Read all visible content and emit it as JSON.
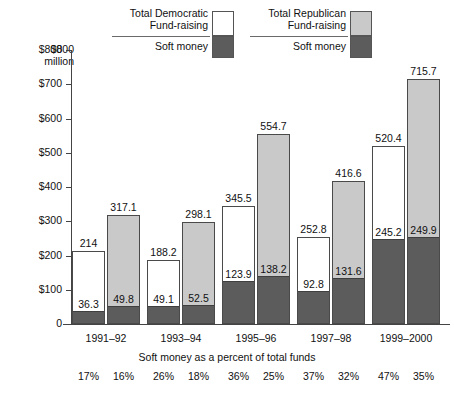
{
  "chart_data": {
    "type": "bar",
    "title": "",
    "subtitle": "",
    "xlabel": "",
    "ylabel": "$800 million",
    "ylim": [
      0,
      800
    ],
    "ytick_values": [
      0,
      100,
      200,
      300,
      400,
      500,
      600,
      700,
      800
    ],
    "ytick_labels": [
      "0",
      "$100",
      "$200",
      "$300",
      "$400",
      "$500",
      "$600",
      "$700",
      "$800"
    ],
    "grid": false,
    "legend_position": "top-center",
    "categories": [
      "1991–92",
      "1993–94",
      "1995–96",
      "1997–98",
      "1999–2000"
    ],
    "series": [
      {
        "name": "Total Democratic Fund-raising",
        "fill": "white",
        "values": [
          214,
          188.2,
          345.5,
          252.8,
          520.4
        ],
        "value_labels": [
          "214",
          "188.2",
          "345.5",
          "252.8",
          "520.4"
        ],
        "soft_money": [
          36.3,
          49.1,
          123.9,
          92.8,
          245.2
        ],
        "soft_money_labels": [
          "36.3",
          "49.1",
          "123.9",
          "92.8",
          "245.2"
        ],
        "soft_money_percent": [
          "17%",
          "26%",
          "36%",
          "37%",
          "47%"
        ]
      },
      {
        "name": "Total Republican Fund-raising",
        "fill": "light-gray",
        "values": [
          317.1,
          298.1,
          554.7,
          416.6,
          715.7
        ],
        "value_labels": [
          "317.1",
          "298.1",
          "554.7",
          "416.6",
          "715.7"
        ],
        "soft_money": [
          49.8,
          52.5,
          138.2,
          131.6,
          249.9
        ],
        "soft_money_labels": [
          "49.8",
          "52.5",
          "138.2",
          "131.6",
          "249.9"
        ],
        "soft_money_percent": [
          "16%",
          "18%",
          "25%",
          "32%",
          "35%"
        ]
      }
    ],
    "annotations": [
      "Soft money as a percent of total funds"
    ]
  },
  "axis": {
    "unit_line1": "$800",
    "unit_line2": "million",
    "zero_label": "0",
    "tick_labels": [
      "$700",
      "$600",
      "$500",
      "$400",
      "$300",
      "$200",
      "$100"
    ]
  },
  "legend": {
    "democratic": {
      "title_line1": "Total Democratic",
      "title_line2": "Fund-raising",
      "soft_label": "Soft money"
    },
    "republican": {
      "title_line1": "Total Republican",
      "title_line2": "Fund-raising",
      "soft_label": "Soft money"
    }
  },
  "footnote": "Soft money as a percent of total funds",
  "colors": {
    "democratic_fill": "#ffffff",
    "republican_fill": "#c9c9c9",
    "soft_money_fill": "#5c5c5c",
    "outline": "#4a4a4a"
  }
}
